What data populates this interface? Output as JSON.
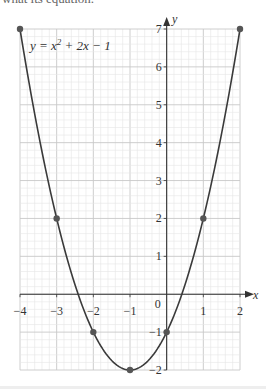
{
  "header_text": "what its equation.",
  "chart_data": {
    "type": "line",
    "title": "",
    "equation_label": "y = x² + 2x − 1",
    "xlabel": "x",
    "ylabel": "y",
    "xlim": [
      -4,
      2
    ],
    "ylim": [
      -2,
      7
    ],
    "x_ticks": [
      -4,
      -3,
      -2,
      -1,
      0,
      1,
      2
    ],
    "y_ticks": [
      -2,
      -1,
      1,
      2,
      3,
      4,
      5,
      6,
      7
    ],
    "grid": {
      "major": 1,
      "minor": 0.2
    },
    "series": [
      {
        "name": "y = x^2 + 2x - 1",
        "x": [
          -4,
          -3,
          -2,
          -1,
          0,
          1,
          2
        ],
        "values": [
          7,
          2,
          -1,
          -2,
          -1,
          2,
          7
        ]
      }
    ],
    "marked_points": [
      [
        -4,
        7
      ],
      [
        -3,
        2
      ],
      [
        -2,
        -1
      ],
      [
        -1,
        -2
      ],
      [
        0,
        -1
      ],
      [
        1,
        2
      ],
      [
        2,
        7
      ]
    ],
    "colors": {
      "curve": "#3a3a3a",
      "points": "#555555",
      "grid_major": "#c8c8c8",
      "grid_minor": "#e6e6e6",
      "axes": "#333333"
    }
  }
}
